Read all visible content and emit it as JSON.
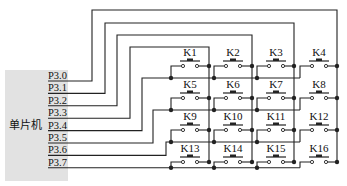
{
  "diagram": {
    "type": "4x4 matrix keypad circuit",
    "mcu_label": "单片机",
    "pins": [
      "P3.0",
      "P3.1",
      "P3.2",
      "P3.3",
      "P3.4",
      "P3.5",
      "P3.6",
      "P3.7"
    ],
    "keys": [
      "K1",
      "K2",
      "K3",
      "K4",
      "K5",
      "K6",
      "K7",
      "K8",
      "K9",
      "K10",
      "K11",
      "K12",
      "K13",
      "K14",
      "K15",
      "K16"
    ],
    "columns_connected_to": [
      "P3.3",
      "P3.2",
      "P3.1",
      "P3.0"
    ],
    "rows_connected_to": [
      "P3.4",
      "P3.5",
      "P3.6",
      "P3.7"
    ],
    "colors": {
      "wire": "#222222",
      "chip_fill": "#e2e2e2",
      "background": "#ffffff"
    }
  }
}
